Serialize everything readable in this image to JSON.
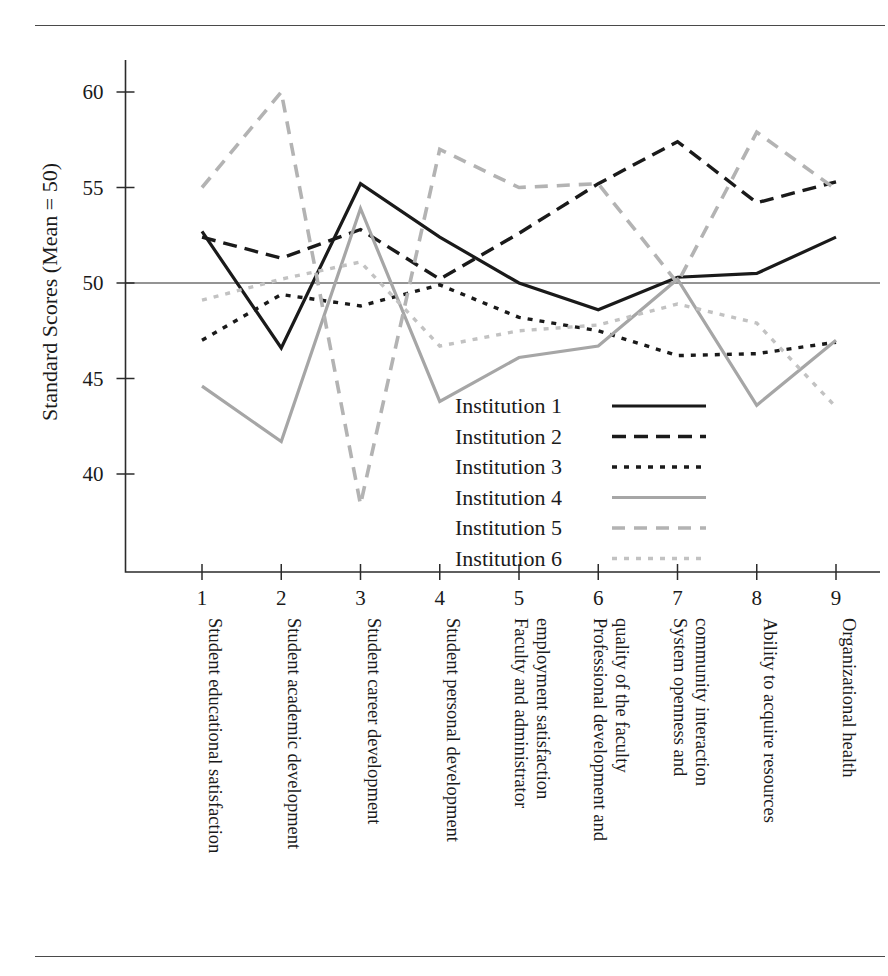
{
  "figure": {
    "top_rule": "horizontal-rule",
    "bottom_rule": "horizontal-rule"
  },
  "chart_data": {
    "type": "line",
    "title": "",
    "subtitle": "",
    "xlabel": "",
    "ylabel": "Standard Scores (Mean = 50)",
    "ylim": [
      36,
      61.5
    ],
    "yticks": [
      40,
      45,
      50,
      55,
      60
    ],
    "ytick_labels": [
      "40",
      "45",
      "50",
      "55",
      "60"
    ],
    "xticks": [
      1,
      2,
      3,
      4,
      5,
      6,
      7,
      8,
      9
    ],
    "xtick_labels": [
      "1",
      "2",
      "3",
      "4",
      "5",
      "6",
      "7",
      "8",
      "9"
    ],
    "grid": false,
    "reference_line": {
      "value": 50,
      "label": "Mean = 50"
    },
    "legend_position": "center-right-inside",
    "categories": [
      "Student educational satisfaction",
      "Student academic development",
      "Student career development",
      "Student personal development",
      "Faculty and administrator employment satisfaction",
      "Professional development and quality of the faculty",
      "System openness and community interaction",
      "Ability to acquire resources",
      "Organizational health"
    ],
    "category_lines": [
      [
        "Student educational satisfaction"
      ],
      [
        "Student academic development"
      ],
      [
        "Student career development"
      ],
      [
        "Student personal development"
      ],
      [
        "Faculty and administrator",
        "employment satisfaction"
      ],
      [
        "Professional development and",
        "quality of the faculty"
      ],
      [
        "System openness and",
        "community interaction"
      ],
      [
        "Ability to acquire resources"
      ],
      [
        "Organizational health"
      ]
    ],
    "series": [
      {
        "name": "Institution 1",
        "style": "solid",
        "color": "#1a1a1a",
        "width": 3.2,
        "dash": "",
        "values": [
          52.7,
          46.6,
          55.2,
          52.4,
          50.0,
          48.6,
          50.3,
          50.5,
          52.4
        ]
      },
      {
        "name": "Institution 2",
        "style": "dashed",
        "color": "#1a1a1a",
        "width": 3.4,
        "dash": "14,8",
        "values": [
          52.4,
          51.3,
          52.8,
          50.2,
          52.6,
          55.2,
          57.4,
          54.2,
          55.3
        ]
      },
      {
        "name": "Institution 3",
        "style": "dotted",
        "color": "#1a1a1a",
        "width": 3.4,
        "dash": "5,7",
        "values": [
          47.0,
          49.4,
          48.8,
          49.9,
          48.2,
          47.5,
          46.2,
          46.3,
          46.9
        ]
      },
      {
        "name": "Institution 4",
        "style": "solid",
        "color": "#a6a6a6",
        "width": 3.2,
        "dash": "",
        "values": [
          44.6,
          41.7,
          53.9,
          43.8,
          46.1,
          46.7,
          50.2,
          43.6,
          47.0
        ]
      },
      {
        "name": "Institution 5",
        "style": "dashed",
        "color": "#b3b3b3",
        "width": 3.6,
        "dash": "13,9",
        "values": [
          55.0,
          60.0,
          38.4,
          57.0,
          55.0,
          55.2,
          50.0,
          57.9,
          54.9
        ]
      },
      {
        "name": "Institution 6",
        "style": "dotted",
        "color": "#c2c2c2",
        "width": 3.4,
        "dash": "5,7",
        "values": [
          49.1,
          50.2,
          51.1,
          46.7,
          47.5,
          47.8,
          48.9,
          47.9,
          43.5
        ]
      }
    ]
  },
  "legend": {
    "items": [
      {
        "label": "Institution 1"
      },
      {
        "label": "Institution 2"
      },
      {
        "label": "Institution 3"
      },
      {
        "label": "Institution 4"
      },
      {
        "label": "Institution 5"
      },
      {
        "label": "Institution 6"
      }
    ]
  }
}
